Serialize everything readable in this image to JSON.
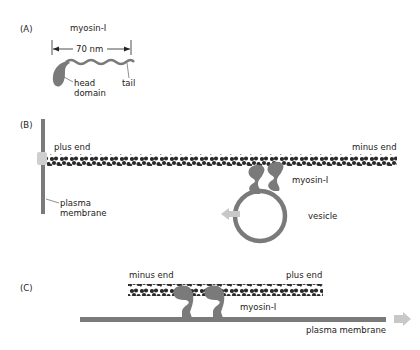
{
  "panels": {
    "a": {
      "letter": "(A)",
      "title": "myosin-I",
      "length_label": "70 nm",
      "head_label_1": "head",
      "head_label_2": "domain",
      "tail_label": "tail"
    },
    "b": {
      "letter": "(B)",
      "plus_end": "plus end",
      "minus_end": "minus end",
      "membrane_1": "plasma",
      "membrane_2": "membrane",
      "myosin": "myosin-I",
      "vesicle": "vesicle"
    },
    "c": {
      "letter": "(C)",
      "minus_end": "minus end",
      "plus_end": "plus end",
      "myosin": "myosin-I",
      "membrane": "plasma membrane"
    }
  },
  "colors": {
    "protein_gray": "#7a7a7a",
    "actin_dark": "#2a2a2a",
    "arrow_light": "#c8c8c8",
    "cap_light": "#cfcfcf"
  }
}
